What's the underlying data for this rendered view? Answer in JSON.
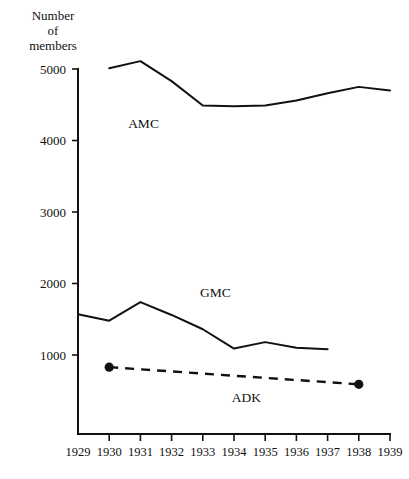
{
  "chart_data": {
    "type": "line",
    "title": "",
    "ylabel": "Number\nof\nmembers",
    "xlabel": "",
    "x": [
      1929,
      1930,
      1931,
      1932,
      1933,
      1934,
      1935,
      1936,
      1937,
      1938,
      1939
    ],
    "xtick_labels": [
      "1929",
      "1930",
      "1931",
      "1932",
      "1933",
      "1934",
      "1935",
      "1936",
      "1937",
      "1938",
      "1939"
    ],
    "ytick_labels": [
      "1000",
      "2000",
      "3000",
      "4000",
      "5000"
    ],
    "ytick_values": [
      1000,
      2000,
      3000,
      4000,
      5000
    ],
    "xlim": [
      1929,
      1939
    ],
    "ylim": [
      0,
      5200
    ],
    "grid": false,
    "legend": "inline-labels",
    "series": [
      {
        "name": "AMC",
        "label": "AMC",
        "style": "solid",
        "x": [
          1930,
          1931,
          1932,
          1933,
          1934,
          1935,
          1936,
          1937,
          1938,
          1939
        ],
        "values": [
          5010,
          5110,
          4830,
          4490,
          4480,
          4490,
          4560,
          4660,
          4750,
          4700
        ]
      },
      {
        "name": "GMC",
        "label": "GMC",
        "style": "solid",
        "x": [
          1929,
          1930,
          1931,
          1932,
          1933,
          1934,
          1935,
          1936,
          1937
        ],
        "values": [
          1570,
          1480,
          1740,
          1560,
          1360,
          1090,
          1180,
          1100,
          1080
        ]
      },
      {
        "name": "ADK",
        "label": "ADK",
        "style": "dashed",
        "markers": "endpoints",
        "x": [
          1930,
          1938
        ],
        "values": [
          830,
          590
        ]
      }
    ],
    "annotations": [
      {
        "text": "AMC",
        "x": 1931.1,
        "y": 4180
      },
      {
        "text": "GMC",
        "x": 1933.4,
        "y": 1810
      },
      {
        "text": "ADK",
        "x": 1934.4,
        "y": 340
      }
    ]
  }
}
